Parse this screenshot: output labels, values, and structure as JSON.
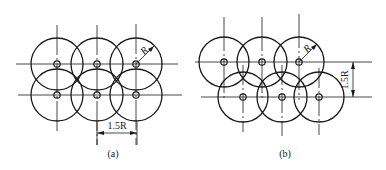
{
  "figures": [
    {
      "id": "a",
      "caption": "(a)",
      "layout": "square-grid",
      "radius_label": "R",
      "dimension_label": "1.5R",
      "dimension_orientation": "horizontal",
      "rows": [
        {
          "y": 64,
          "x": [
            57,
            97,
            136
          ]
        },
        {
          "y": 95,
          "x": [
            57,
            97,
            136
          ]
        }
      ]
    },
    {
      "id": "b",
      "caption": "(b)",
      "layout": "staggered",
      "radius_label": "R",
      "dimension_label": "1.5R",
      "dimension_orientation": "vertical",
      "rows": [
        {
          "y": 62,
          "x": [
            224,
            262,
            299
          ]
        },
        {
          "y": 97,
          "x": [
            243,
            282,
            319
          ]
        }
      ]
    }
  ],
  "style": {
    "line_color": "#1a1a1a",
    "background": "#ffffff"
  }
}
